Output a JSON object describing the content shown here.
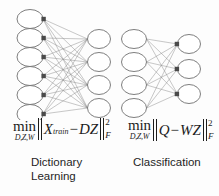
{
  "figure": {
    "background_color": "#fdfdfd",
    "node_stroke_color": "#6f6f6f",
    "node_fill_color": "#ffffff",
    "edge_color": "#8a8a8a",
    "marker_color": "#4a4a4a",
    "text_color": "#1c1c1c"
  },
  "networks": [
    {
      "name": "dictionary-learning-network",
      "left_layer": {
        "label": "input-nodes",
        "count": 6,
        "cx": 30,
        "rx": 13,
        "ry": 9.5,
        "first_cy": 19,
        "spacing": 19,
        "marker_side": "right"
      },
      "right_layer": {
        "label": "output-nodes",
        "count": 4,
        "cx": 99,
        "rx": 11.5,
        "ry": 9.5,
        "first_cy": 39,
        "spacing": 23,
        "marker_side": "none"
      }
    },
    {
      "name": "classification-network",
      "left_layer": {
        "label": "input-nodes",
        "count": 4,
        "cx": 134,
        "rx": 12.5,
        "ry": 9.5,
        "first_cy": 39,
        "spacing": 23,
        "marker_side": "none"
      },
      "right_layer": {
        "label": "output-nodes",
        "count": 3,
        "cx": 189,
        "rx": 11.5,
        "ry": 9.5,
        "first_cy": 44,
        "spacing": 25,
        "marker_side": "left"
      }
    }
  ],
  "formulas": [
    {
      "name": "dictionary-learning-objective",
      "min_operator": "min",
      "min_subscript": "D,Z,W",
      "term_1": "X",
      "term_1_subscript": "train",
      "operator": "−",
      "term_2": "DZ",
      "norm_superscript": "2",
      "norm_subscript": "F",
      "plain_text": "min_{D,Z,W} ||X_train − DZ||^2_F"
    },
    {
      "name": "classification-objective",
      "min_operator": "min",
      "min_subscript": "D,Z,W",
      "term_1": "Q",
      "term_1_subscript": "",
      "operator": "−",
      "term_2": "WZ",
      "norm_superscript": "2",
      "norm_subscript": "F",
      "plain_text": "min_{D,Z,W} ||Q − WZ||^2_F"
    }
  ],
  "captions": [
    {
      "name": "dictionary-learning-caption",
      "text": "Dictionary\nLearning"
    },
    {
      "name": "classification-caption",
      "text": "Classification"
    }
  ]
}
